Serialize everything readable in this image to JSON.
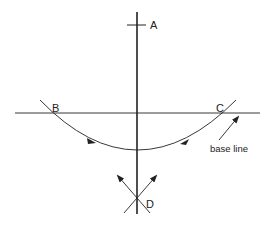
{
  "diagram": {
    "labels": {
      "A": "A",
      "B": "B",
      "C": "C",
      "D": "D",
      "base_line": "base line"
    },
    "colors": {
      "stroke": "#222222",
      "background": "#ffffff"
    },
    "elements": {
      "perpendicular_line": {
        "x": 137,
        "y_top": 12,
        "y_bottom": 214
      },
      "point_A_tick": {
        "x1": 127,
        "x2": 146,
        "y": 25
      },
      "base_line": {
        "x1": 15,
        "x2": 260,
        "y": 113
      },
      "arc_BC": {
        "start": [
          40,
          100
        ],
        "bottom": [
          137,
          151
        ],
        "end": [
          236,
          100
        ]
      },
      "intersection_D": {
        "x": 137,
        "y": 202
      }
    }
  }
}
